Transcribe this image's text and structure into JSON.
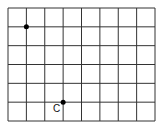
{
  "grid": {
    "columns": 8,
    "rows": 6,
    "line_color": "#333333"
  },
  "points": [
    {
      "col": 1,
      "row": 1,
      "label": ""
    },
    {
      "col": 3,
      "row": 5,
      "label": "C"
    }
  ]
}
